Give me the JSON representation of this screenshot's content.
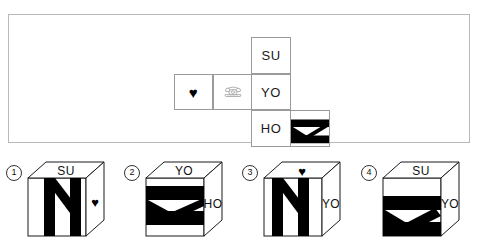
{
  "puzzle": {
    "type": "cube-net-folding",
    "net": {
      "description": "Cross-shaped net of a cube with six faces",
      "faces": [
        {
          "id": "su",
          "label": "SU",
          "kind": "text",
          "grid": {
            "col": 3,
            "row": 1
          }
        },
        {
          "id": "heart",
          "label": "♥",
          "kind": "icon",
          "icon": "heart-icon",
          "grid": {
            "col": 1,
            "row": 2
          }
        },
        {
          "id": "phone",
          "label": "",
          "kind": "icon",
          "icon": "telephone-icon",
          "grid": {
            "col": 2,
            "row": 2
          }
        },
        {
          "id": "yo",
          "label": "YO",
          "kind": "text",
          "grid": {
            "col": 3,
            "row": 2
          }
        },
        {
          "id": "ho",
          "label": "HO",
          "kind": "text",
          "grid": {
            "col": 3,
            "row": 3
          }
        },
        {
          "id": "zig",
          "label": "",
          "kind": "figure",
          "icon": "black-zigzag-icon",
          "grid": {
            "col": 4,
            "row": 3
          }
        }
      ]
    },
    "options": [
      {
        "number": "①",
        "number_plain": "1",
        "top_label": "SU",
        "right_label": "",
        "top_icon": "",
        "right_icon": "heart-icon",
        "front_icon": "black-zigzag-icon",
        "front_orientation": "vertical-n"
      },
      {
        "number": "②",
        "number_plain": "2",
        "top_label": "YO",
        "right_label": "HO",
        "top_icon": "",
        "right_icon": "",
        "front_icon": "black-zigzag-icon",
        "front_orientation": "horizontal-z"
      },
      {
        "number": "③",
        "number_plain": "3",
        "top_label": "",
        "right_label": "YO",
        "top_icon": "heart-icon",
        "right_icon": "",
        "front_icon": "black-zigzag-icon",
        "front_orientation": "vertical-n"
      },
      {
        "number": "④",
        "number_plain": "4",
        "top_label": "SU",
        "right_label": "YO",
        "top_icon": "",
        "right_icon": "",
        "front_icon": "black-zigzag-icon",
        "front_orientation": "horizontal-z-flipped"
      }
    ]
  },
  "colors": {
    "ink": "#111111",
    "fill_black": "#000000",
    "frame": "#b9b9b9",
    "cell_border": "#9a9a9a",
    "phone_gray": "#b0b0b0",
    "page_background": "#ffffff"
  }
}
